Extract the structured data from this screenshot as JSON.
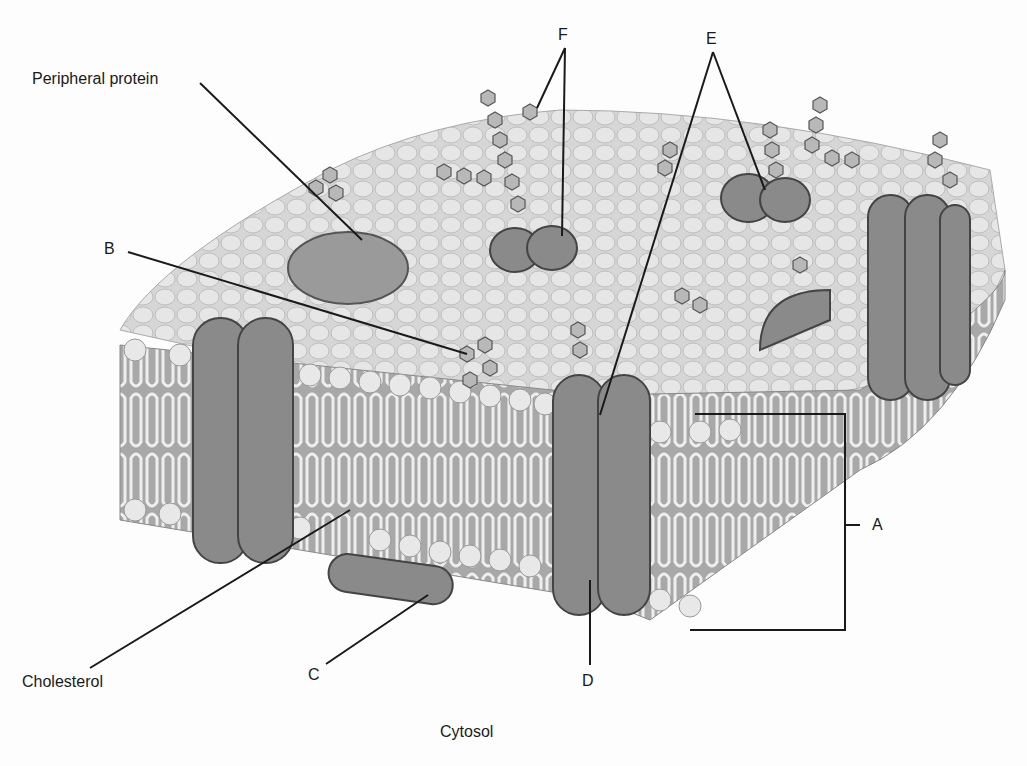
{
  "diagram": {
    "labels": {
      "peripheral_protein": "Peripheral protein",
      "b": "B",
      "f": "F",
      "e": "E",
      "a": "A",
      "cholesterol": "Cholesterol",
      "c": "C",
      "d": "D",
      "cytosol": "Cytosol"
    },
    "colors": {
      "background": "#fdfdfd",
      "surface": "#d9d9d9",
      "head_light": "#ececec",
      "head_dark": "#9a9a9a",
      "protein": "#8a8a8a",
      "protein_dark": "#6e6e6e",
      "line": "#1a1a1a"
    }
  }
}
